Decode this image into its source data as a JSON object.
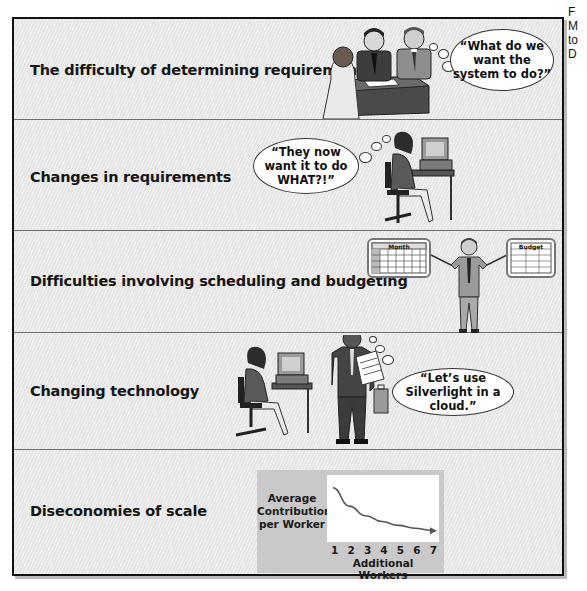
{
  "side_text": [
    "F",
    "M",
    "to",
    "D"
  ],
  "rows": [
    {
      "label": "The difficulty of determining requirements",
      "bubble_text": "“What do we want the system to do?”",
      "illustration": "meeting-three-people-at-desk"
    },
    {
      "label": "Changes in requirements",
      "bubble_text": "“They now want it to do WHAT?!”",
      "illustration": "woman-at-computer-desk"
    },
    {
      "label": "Difficulties involving scheduling and budgeting",
      "calendar_title": "Month",
      "budget_title": "Budget",
      "illustration": "man-pointing-at-calendar-and-budget"
    },
    {
      "label": "Changing technology",
      "bubble_text": "“Let’s use Silverlight in a cloud.”",
      "illustration": "salesman-with-newspaper-and-woman-at-computer"
    },
    {
      "label": "Diseconomies of scale",
      "illustration": "chart-diminishing-returns"
    }
  ],
  "colors": {
    "frame_border": "#111111",
    "row_background": "#ebebeb",
    "chart_panel": "#c9c9c9",
    "curve": "#555555"
  },
  "chart_data": {
    "type": "line",
    "title": "",
    "ylabel": "Average Contribution per Worker",
    "xlabel": "Additional Workers",
    "categories": [
      1,
      2,
      3,
      4,
      5,
      6,
      7
    ],
    "x": [
      1,
      2,
      3,
      4,
      5,
      6,
      7
    ],
    "series": [
      {
        "name": "Average Contribution per Worker",
        "values": [
          1.0,
          0.62,
          0.42,
          0.3,
          0.22,
          0.16,
          0.12
        ]
      }
    ],
    "ylim": [
      0,
      1.1
    ],
    "yticks_shown": false,
    "grid": false,
    "legend": "none",
    "annotations": [
      "arrowhead at end of curve"
    ]
  }
}
